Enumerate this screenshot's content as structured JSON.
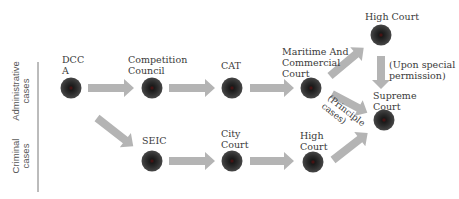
{
  "diagram": {
    "type": "legal-appeal-flow",
    "rows": {
      "administrative": "Administrative\ncases",
      "criminal": "Criminal\ncases"
    },
    "nodes": [
      {
        "id": "dcca",
        "label": "DCC\nA"
      },
      {
        "id": "competition-council",
        "label": "Competition\nCouncil"
      },
      {
        "id": "cat",
        "label": "CAT"
      },
      {
        "id": "maritime",
        "label": "Maritime And\nCommercial\nCourt"
      },
      {
        "id": "high-court-top",
        "label": "High Court"
      },
      {
        "id": "supreme-court",
        "label": "Supreme\nCourt"
      },
      {
        "id": "seic",
        "label": "SEIC"
      },
      {
        "id": "city-court",
        "label": "City\nCourt"
      },
      {
        "id": "high-court-bottom",
        "label": "High\nCourt"
      }
    ],
    "edge_labels": {
      "special_permission": "(Upon special\npermission)",
      "principle_cases": "(Principle\ncases)"
    },
    "edges": [
      {
        "from": "dcca",
        "to": "competition-council"
      },
      {
        "from": "competition-council",
        "to": "cat"
      },
      {
        "from": "cat",
        "to": "maritime"
      },
      {
        "from": "maritime",
        "to": "high-court-top"
      },
      {
        "from": "maritime",
        "to": "supreme-court",
        "label": "(Principle cases)"
      },
      {
        "from": "high-court-top",
        "to": "supreme-court",
        "label": "(Upon special permission)"
      },
      {
        "from": "dcca",
        "to": "seic"
      },
      {
        "from": "seic",
        "to": "city-court"
      },
      {
        "from": "city-court",
        "to": "high-court-bottom"
      },
      {
        "from": "high-court-bottom",
        "to": "supreme-court"
      }
    ],
    "colors": {
      "node_outer": "#3c3c3c",
      "node_inner": "#1a1a1a",
      "node_core": "#5a1010",
      "arrow": "#b4b4b4",
      "divider": "#555555"
    }
  }
}
